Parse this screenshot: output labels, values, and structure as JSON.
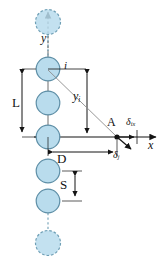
{
  "figure": {
    "type": "schematic-diagram",
    "background_color": "#ffffff",
    "line_color": "#1a1a1a",
    "circle_fill": "#b9dced",
    "circle_stroke": "#5d8ea6",
    "dashed_circle_stroke": "#6f9fb5"
  },
  "axes": {
    "x": {
      "label": "x",
      "italic": true,
      "orientation": "horizontal",
      "arrow": "right"
    },
    "y": {
      "label": "y",
      "italic": true,
      "orientation": "vertical",
      "arrow": "up"
    },
    "origin_note": "axis crosshair at lowest solid pile of the L span"
  },
  "piles": [
    {
      "id": "top-ghost",
      "style": "dashed",
      "cx": 48,
      "cy": 22,
      "r": 13
    },
    {
      "id": "pile-i",
      "style": "solid",
      "cx": 48,
      "cy": 69,
      "r": 12
    },
    {
      "id": "pile-2",
      "style": "solid",
      "cx": 48,
      "cy": 103,
      "r": 12
    },
    {
      "id": "pile-3",
      "style": "solid",
      "cx": 48,
      "cy": 137,
      "r": 12
    },
    {
      "id": "pile-4",
      "style": "solid",
      "cx": 48,
      "cy": 171,
      "r": 12
    },
    {
      "id": "pile-5",
      "style": "solid",
      "cx": 48,
      "cy": 201,
      "r": 12
    },
    {
      "id": "bottom-ghost",
      "style": "dashed",
      "cx": 48,
      "cy": 243,
      "r": 13
    }
  ],
  "labels": {
    "L": {
      "text": "L",
      "meaning": "overall length of pile row span"
    },
    "D": {
      "text": "D",
      "meaning": "horizontal distance from pile row to point A"
    },
    "S": {
      "text": "S",
      "meaning": "centre-to-centre pile spacing"
    },
    "i": {
      "text": "i",
      "italic": true,
      "meaning": "index of the considered pile"
    },
    "A": {
      "text": "A",
      "italic": false,
      "meaning": "point of interest on the x axis"
    },
    "y_i": {
      "base": "y",
      "sub": "i",
      "meaning": "vertical distance from x axis to pile i"
    },
    "delta_ix": {
      "base": "δ",
      "sub": "ix",
      "meaning": "horizontal displacement component at A due to pile i"
    },
    "delta_j": {
      "base": "δ",
      "sub": "j",
      "meaning": "resultant displacement at A due to pile j"
    },
    "x_axis": {
      "text": "x",
      "italic": true
    },
    "y_axis": {
      "text": "y",
      "italic": true
    }
  },
  "dimension_lines": [
    {
      "name": "L-dimension",
      "orientation": "vertical",
      "x": 22,
      "from_y": 69,
      "to_y": 137,
      "arrows": "both"
    },
    {
      "name": "y-i-dimension",
      "orientation": "vertical",
      "x": 87,
      "from_y": 69,
      "to_y": 137,
      "arrows": "both"
    },
    {
      "name": "D-dimension",
      "orientation": "horizontal",
      "y": 152,
      "from_x": 48,
      "to_x": 118,
      "arrows": "both"
    },
    {
      "name": "S-dimension",
      "orientation": "vertical",
      "x": 75,
      "from_y": 171,
      "to_y": 201,
      "arrows": "both"
    }
  ],
  "vectors": [
    {
      "name": "ray-i-to-A",
      "from": [
        48,
        69
      ],
      "to": [
        117,
        137
      ],
      "style": "thin-solid"
    },
    {
      "name": "delta-ix-vector",
      "from": [
        117,
        137
      ],
      "to": [
        137,
        137
      ],
      "style": "arrow-right"
    },
    {
      "name": "delta-j-vector",
      "from": [
        117,
        137
      ],
      "to": [
        133,
        150
      ],
      "style": "arrow-diagonal"
    }
  ]
}
